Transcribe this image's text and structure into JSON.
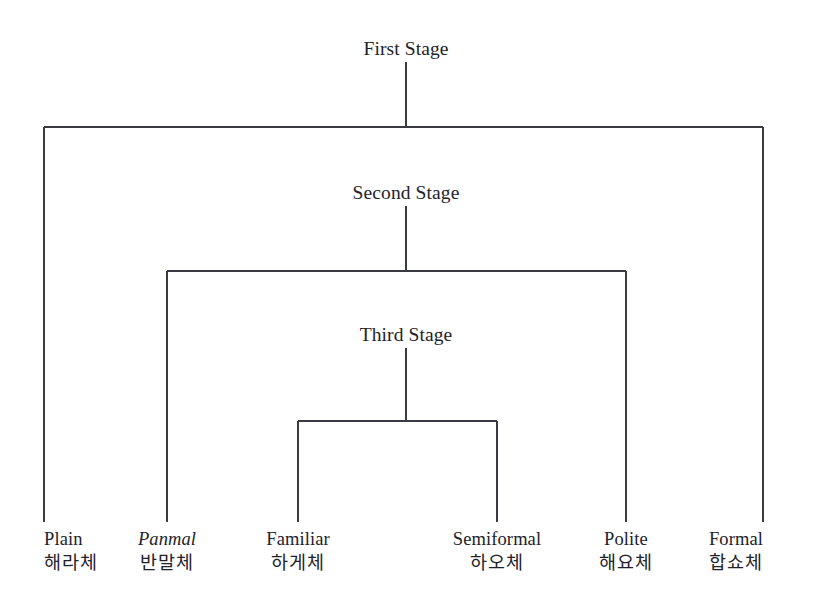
{
  "diagram": {
    "type": "tree",
    "orientation": "top-down",
    "line_color": "#3a3a42",
    "text_color": "#22222a",
    "background_color": "#ffffff",
    "stages": [
      {
        "id": "first",
        "label": "First Stage"
      },
      {
        "id": "second",
        "label": "Second Stage"
      },
      {
        "id": "third",
        "label": "Third Stage"
      }
    ],
    "leaves": [
      {
        "id": "plain",
        "romanized": "Plain",
        "hangul": "해라체",
        "italic": false,
        "stage": "first"
      },
      {
        "id": "panmal",
        "romanized": "Panmal",
        "hangul": "반말체",
        "italic": true,
        "stage": "second"
      },
      {
        "id": "familiar",
        "romanized": "Familiar",
        "hangul": "하게체",
        "italic": false,
        "stage": "third"
      },
      {
        "id": "semiformal",
        "romanized": "Semiformal",
        "hangul": "하오체",
        "italic": false,
        "stage": "third"
      },
      {
        "id": "polite",
        "romanized": "Polite",
        "hangul": "해요체",
        "italic": false,
        "stage": "second"
      },
      {
        "id": "formal",
        "romanized": "Formal",
        "hangul": "합쇼체",
        "italic": false,
        "stage": "first"
      }
    ]
  },
  "layout": {
    "trunk_x": 406,
    "stage_label_y": [
      38,
      182,
      324
    ],
    "stage_stem": [
      {
        "x": 406,
        "y1": 62,
        "y2": 127
      },
      {
        "x": 406,
        "y1": 206,
        "y2": 271
      },
      {
        "x": 406,
        "y1": 348,
        "y2": 421
      }
    ],
    "crossbars": [
      {
        "y": 127,
        "x1": 44,
        "x2": 763
      },
      {
        "y": 271,
        "x1": 167,
        "x2": 626
      },
      {
        "y": 421,
        "x1": 298,
        "x2": 497
      }
    ],
    "leaf_drops": [
      {
        "x": 44,
        "y1": 127,
        "y2": 522
      },
      {
        "x": 167,
        "y1": 271,
        "y2": 522
      },
      {
        "x": 298,
        "y1": 421,
        "y2": 522
      },
      {
        "x": 497,
        "y1": 421,
        "y2": 522
      },
      {
        "x": 626,
        "y1": 271,
        "y2": 522
      },
      {
        "x": 763,
        "y1": 127,
        "y2": 522
      }
    ],
    "leaf_label_y": 530,
    "leaf_anchor": [
      "edge-left",
      "center",
      "center",
      "center",
      "center",
      "edge-right"
    ]
  }
}
